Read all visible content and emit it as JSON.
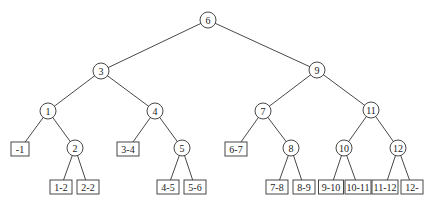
{
  "diagram": {
    "type": "binary-search-tree",
    "internal_nodes": [
      {
        "id": "n6",
        "label": "6",
        "x": 208,
        "y": 20
      },
      {
        "id": "n3",
        "label": "3",
        "x": 101,
        "y": 71
      },
      {
        "id": "n9",
        "label": "9",
        "x": 317,
        "y": 70
      },
      {
        "id": "n1",
        "label": "1",
        "x": 48,
        "y": 111
      },
      {
        "id": "n4",
        "label": "4",
        "x": 155,
        "y": 111
      },
      {
        "id": "n7",
        "label": "7",
        "x": 263,
        "y": 111
      },
      {
        "id": "n11",
        "label": "11",
        "x": 371,
        "y": 110
      },
      {
        "id": "n2",
        "label": "2",
        "x": 75,
        "y": 148
      },
      {
        "id": "n5",
        "label": "5",
        "x": 182,
        "y": 148
      },
      {
        "id": "n8",
        "label": "8",
        "x": 291,
        "y": 148
      },
      {
        "id": "n10",
        "label": "10",
        "x": 344,
        "y": 148
      },
      {
        "id": "n12",
        "label": "12",
        "x": 398,
        "y": 148
      }
    ],
    "leaves": [
      {
        "id": "l-1",
        "label": "-1",
        "x": 20,
        "y": 149,
        "w": 18
      },
      {
        "id": "l3-4",
        "label": "3-4",
        "x": 128,
        "y": 149,
        "w": 22
      },
      {
        "id": "l6-7",
        "label": "6-7",
        "x": 236,
        "y": 149,
        "w": 22
      },
      {
        "id": "l1-2",
        "label": "1-2",
        "x": 61,
        "y": 187,
        "w": 22
      },
      {
        "id": "l2-2",
        "label": "2-2",
        "x": 88,
        "y": 187,
        "w": 22
      },
      {
        "id": "l4-5",
        "label": "4-5",
        "x": 168,
        "y": 187,
        "w": 22
      },
      {
        "id": "l5-6",
        "label": "5-6",
        "x": 195,
        "y": 187,
        "w": 22
      },
      {
        "id": "l7-8",
        "label": "7-8",
        "x": 277,
        "y": 187,
        "w": 22
      },
      {
        "id": "l8-9",
        "label": "8-9",
        "x": 304,
        "y": 187,
        "w": 22
      },
      {
        "id": "l9-10",
        "label": "9-10",
        "x": 331,
        "y": 187,
        "w": 25
      },
      {
        "id": "l10-11",
        "label": "10-11",
        "x": 358,
        "y": 187,
        "w": 26
      },
      {
        "id": "l11-12",
        "label": "11-12",
        "x": 385,
        "y": 187,
        "w": 26
      },
      {
        "id": "l12-",
        "label": "12-",
        "x": 412,
        "y": 187,
        "w": 22
      }
    ],
    "edges": [
      [
        "n6",
        "n3"
      ],
      [
        "n6",
        "n9"
      ],
      [
        "n3",
        "n1"
      ],
      [
        "n3",
        "n4"
      ],
      [
        "n9",
        "n7"
      ],
      [
        "n9",
        "n11"
      ],
      [
        "n1",
        "l-1"
      ],
      [
        "n1",
        "n2"
      ],
      [
        "n4",
        "l3-4"
      ],
      [
        "n4",
        "n5"
      ],
      [
        "n7",
        "l6-7"
      ],
      [
        "n7",
        "n8"
      ],
      [
        "n11",
        "n10"
      ],
      [
        "n11",
        "n12"
      ],
      [
        "n2",
        "l1-2"
      ],
      [
        "n2",
        "l2-2"
      ],
      [
        "n5",
        "l4-5"
      ],
      [
        "n5",
        "l5-6"
      ],
      [
        "n8",
        "l7-8"
      ],
      [
        "n8",
        "l8-9"
      ],
      [
        "n10",
        "l9-10"
      ],
      [
        "n10",
        "l10-11"
      ],
      [
        "n12",
        "l11-12"
      ],
      [
        "n12",
        "l12-"
      ]
    ]
  }
}
